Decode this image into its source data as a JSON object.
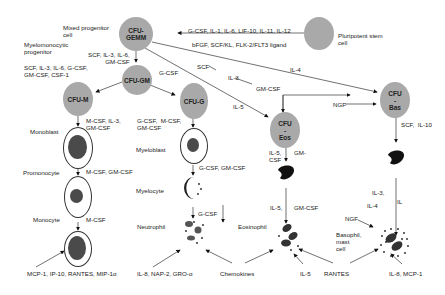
{
  "diagram": {
    "nodes": {
      "pluripotent": {
        "label": "",
        "caption": "Pluripotent stem\ncell"
      },
      "cfu_gemm": {
        "label": "CFU-\nGEMM",
        "caption": "Mixed progenitor\ncell"
      },
      "cfu_gm": {
        "label": "CFU-GM",
        "caption": "Myelomonocytic\nprogenitor"
      },
      "cfu_m": {
        "label": "CFU-M"
      },
      "cfu_g": {
        "label": "CFU-G"
      },
      "cfu_eos": {
        "label": "CFU\n-\nEos"
      },
      "cfu_bas": {
        "label": "CFU\n-\nBas"
      }
    },
    "cells": {
      "monoblast": "Monoblast",
      "promonocyte": "Promonocyte",
      "monocyte": "Monocyte",
      "myeloblast": "Myeloblast",
      "myelocyte": "Myelocyte",
      "neutrophil": "Neutrophil",
      "eosinophil": "Eosinophil",
      "basophil": "Basophil,\nmast\ncell"
    },
    "cytokines": {
      "to_gemm_top": "G-CSF, IL-1, IL-6, LIF-10, IL-11, IL-12",
      "to_gemm_bottom": "bFGF, SCF/KL, FLK-2/FLT3 ligand",
      "gemm_to_gm": "SCF, IL-3, IL-6,\nGM-CSF",
      "gm_to_m": "SCF, IL-3, IL-6, G-CSF,\nGM-CSF, CSF-1",
      "gm_to_g": "G-CSF",
      "scf": "SCF",
      "il3": "IL-3",
      "gmcsf_top": "GM-CSF",
      "il4_top": "IL-4",
      "il5_eos": "IL-5",
      "ngf_bas": "NGF",
      "m_to_monoblast": "M-CSF, IL-3,\nGM-CSF",
      "monoblast_to_promono": "M-CSF, GM-CSF",
      "promono_to_mono": "M-CSF",
      "g_to_myeloblast": "G-CSF,  M-CSF,\nGM-CSF",
      "myeloblast_to_myelocyte": "G-CSF, GM-CSF",
      "myelocyte_to_neut": "G-CSF",
      "eos_il5_csf": "IL-5,\nCSF",
      "eos_gm": "GM-",
      "eos_il5_2": "IL-5,",
      "eos_gmcsf_2": "GM-CSF",
      "bas_scf": "SCF,  IL-10",
      "bas_il3": "IL-3,",
      "bas_il4": "IL-4",
      "bas_il": "IL",
      "bas_ngf": "NGF"
    },
    "bottom": {
      "mono_chemo": "MCP-1, IP-10, RANTES, MIP-1α",
      "neut_chemo": "IL-8, NAP-2, GRO-α",
      "chemokines": "Chemokines",
      "il5": "IL-5",
      "rantes": "RANTES",
      "bas_chemo": "IL-8, MCP-1"
    }
  }
}
